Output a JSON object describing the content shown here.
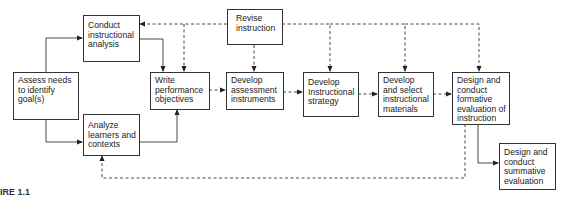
{
  "diagram": {
    "type": "flowchart",
    "nodes": [
      {
        "id": "assess",
        "label": "Assess needs to identify goal(s)"
      },
      {
        "id": "conduct",
        "label": "Conduct instructional analysis"
      },
      {
        "id": "analyze",
        "label": "Analyze learners and contexts"
      },
      {
        "id": "write",
        "label": "Write performance objectives"
      },
      {
        "id": "revise",
        "label": "Revise instruction"
      },
      {
        "id": "assessment",
        "label": "Develop assessment instruments"
      },
      {
        "id": "strategy",
        "label": "Develop Instructional strategy"
      },
      {
        "id": "materials",
        "label": "Develop and select instructional materials"
      },
      {
        "id": "formative",
        "label": "Design and conduct formative evaluation of instruction"
      },
      {
        "id": "summative",
        "label": "Design and conduct summative evaluation"
      }
    ],
    "edges": [
      {
        "from": "assess",
        "to": "conduct",
        "style": "solid"
      },
      {
        "from": "assess",
        "to": "analyze",
        "style": "solid"
      },
      {
        "from": "conduct",
        "to": "write",
        "style": "solid"
      },
      {
        "from": "analyze",
        "to": "write",
        "style": "solid"
      },
      {
        "from": "write",
        "to": "assessment",
        "style": "dashed"
      },
      {
        "from": "assessment",
        "to": "strategy",
        "style": "dashed"
      },
      {
        "from": "strategy",
        "to": "materials",
        "style": "dashed"
      },
      {
        "from": "materials",
        "to": "formative",
        "style": "dashed"
      },
      {
        "from": "formative",
        "to": "summative",
        "style": "solid"
      },
      {
        "from": "formative",
        "to": "analyze",
        "style": "dashed"
      },
      {
        "from": "revise",
        "to": "conduct",
        "style": "dashed"
      },
      {
        "from": "revise",
        "to": "write",
        "style": "dashed"
      },
      {
        "from": "revise",
        "to": "assessment",
        "style": "dashed"
      },
      {
        "from": "revise",
        "to": "strategy",
        "style": "dashed"
      },
      {
        "from": "revise",
        "to": "materials",
        "style": "dashed"
      },
      {
        "from": "revise",
        "to": "formative",
        "style": "dashed"
      }
    ],
    "figure_label": "IRE 1.1"
  }
}
